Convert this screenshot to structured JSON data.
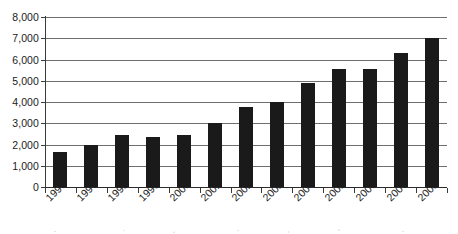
{
  "chart_data": {
    "type": "bar",
    "title": "",
    "xlabel": "",
    "ylabel": "",
    "categories": [
      "1996",
      "1997",
      "1998",
      "1999",
      "2000",
      "2001",
      "2002",
      "2003",
      "2004",
      "2005",
      "2006",
      "2007",
      "2008"
    ],
    "values": [
      1650,
      2000,
      2450,
      2350,
      2450,
      3000,
      3750,
      4000,
      4900,
      5550,
      5550,
      6300,
      7000
    ],
    "ylim": [
      0,
      8000
    ],
    "ytick_values": [
      0,
      1000,
      2000,
      3000,
      4000,
      5000,
      6000,
      7000,
      8000
    ],
    "ytick_labels": [
      "0",
      "1,000",
      "2,000",
      "3,000",
      "4,000",
      "5,000",
      "6,000",
      "7,000",
      "8,000"
    ],
    "grid": true,
    "legend": null,
    "series": [
      {
        "name": "",
        "values": [
          1650,
          2000,
          2450,
          2350,
          2450,
          3000,
          3750,
          4000,
          4900,
          5550,
          5550,
          6300,
          7000
        ]
      }
    ],
    "colors": {
      "bar": "#1a1a1a",
      "gridline": "#6e6e6e",
      "axis": "#3a3a3a",
      "text": "#1b1b1b",
      "background": "#ffffff"
    }
  }
}
